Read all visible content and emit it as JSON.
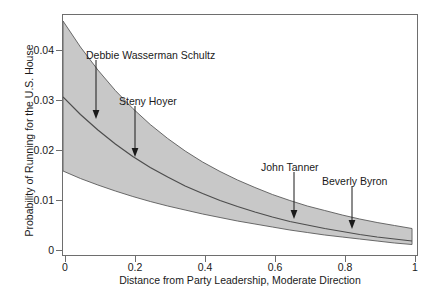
{
  "chart_data": {
    "type": "line",
    "title": "",
    "xlabel": "Distance from Party Leadership, Moderate Direction",
    "ylabel": "Probability of Running for the U.S. House",
    "xlim": [
      0,
      1.02
    ],
    "ylim": [
      0,
      0.0484
    ],
    "grid": false,
    "legend": "none",
    "xticks": [
      "0",
      "0.2",
      "0.4",
      "0.6",
      "0.8",
      "1"
    ],
    "xtick_values": [
      0,
      0.2,
      0.4,
      0.6,
      0.8,
      1
    ],
    "yticks": [
      "0",
      "0.01",
      "0.02",
      "0.03",
      "0.04"
    ],
    "ytick_values": [
      0,
      0.01,
      0.02,
      0.03,
      0.04
    ],
    "x": [
      0,
      0.05,
      0.1,
      0.15,
      0.2,
      0.25,
      0.3,
      0.35,
      0.4,
      0.45,
      0.5,
      0.55,
      0.6,
      0.65,
      0.7,
      0.75,
      0.8,
      0.85,
      0.9,
      0.95,
      1
    ],
    "series": [
      {
        "name": "Predicted probability",
        "role": "mean",
        "values": [
          0.032,
          0.0285,
          0.0254,
          0.0226,
          0.0201,
          0.0179,
          0.016,
          0.0142,
          0.0127,
          0.0113,
          0.0101,
          0.009,
          0.008,
          0.0071,
          0.0064,
          0.0057,
          0.0051,
          0.0045,
          0.004,
          0.0036,
          0.0032
        ]
      },
      {
        "name": "95% confidence band upper",
        "role": "upper",
        "values": [
          0.0472,
          0.042,
          0.0374,
          0.0333,
          0.0297,
          0.0265,
          0.0237,
          0.0212,
          0.019,
          0.0171,
          0.0154,
          0.0139,
          0.0125,
          0.0113,
          0.0102,
          0.0093,
          0.0084,
          0.0076,
          0.0069,
          0.0063,
          0.0057
        ]
      },
      {
        "name": "95% confidence band lower",
        "role": "lower",
        "values": [
          0.0172,
          0.0157,
          0.0144,
          0.0132,
          0.0121,
          0.0111,
          0.0102,
          0.0094,
          0.0086,
          0.0079,
          0.0072,
          0.0066,
          0.006,
          0.0054,
          0.0049,
          0.0044,
          0.004,
          0.0036,
          0.0032,
          0.0028,
          0.0025
        ]
      }
    ],
    "band_fill_color": "#c8c8c8",
    "line_color": "#4d4d4d",
    "axis_color": "#6e6e6e",
    "annotations": [
      {
        "name": "debbie-wasserman-schultz",
        "label": "Debbie Wasserman Schultz",
        "x": 0.08,
        "y": 0.0265
      },
      {
        "name": "steny-hoyer",
        "label": "Steny Hoyer",
        "x": 0.2,
        "y": 0.02
      },
      {
        "name": "john-tanner",
        "label": "John Tanner",
        "x": 0.655,
        "y": 0.0072
      },
      {
        "name": "beverly-byron",
        "label": "Beverly Byron",
        "x": 0.82,
        "y": 0.0045
      }
    ]
  }
}
